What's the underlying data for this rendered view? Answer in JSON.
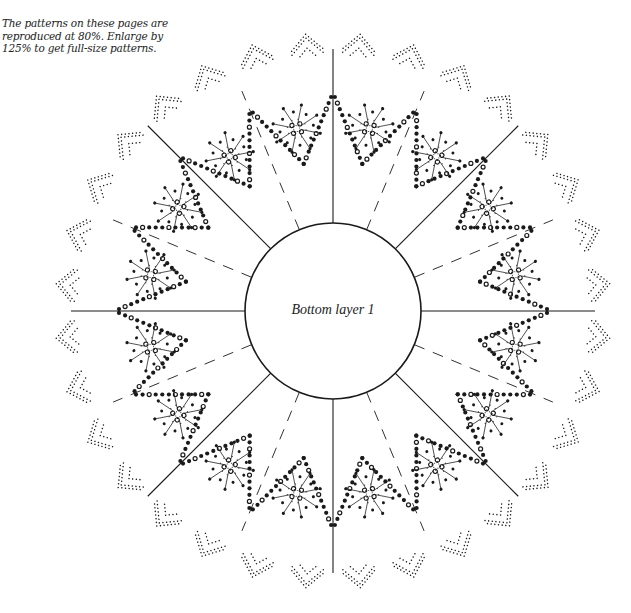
{
  "note": {
    "lines": [
      "The patterns on these pages are",
      "reproduced at 80%. Enlarge by",
      "125% to get full-size patterns."
    ]
  },
  "pattern": {
    "center_label": "Bottom layer 1",
    "center": [
      333,
      311
    ],
    "inner_radius": 88,
    "outer_radius": 258,
    "solid_fold_lines": 8,
    "dashed_fold_lines": 8,
    "star_motifs": 16,
    "lace_points": 32,
    "colors": {
      "ink": "#1a1a1a",
      "paper": "#ffffff"
    }
  }
}
